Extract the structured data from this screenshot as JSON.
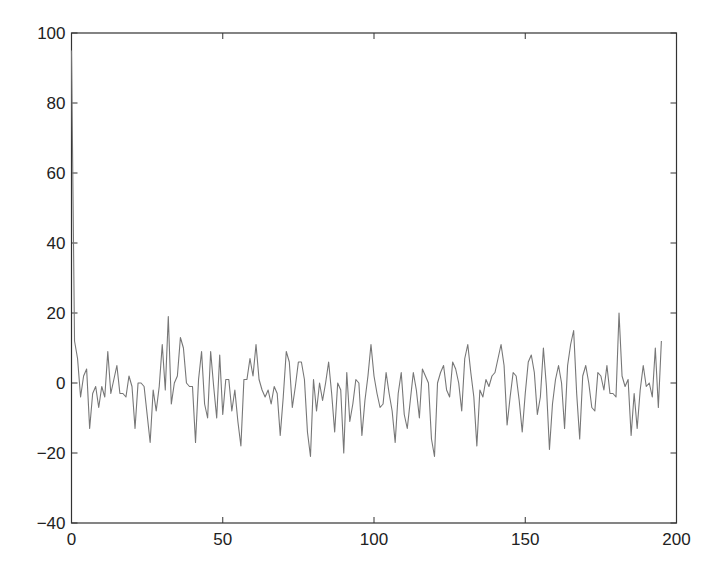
{
  "chart_data": {
    "type": "line",
    "title": "",
    "xlabel": "",
    "ylabel": "",
    "xlim": [
      0,
      200
    ],
    "ylim": [
      -40,
      100
    ],
    "grid": false,
    "legend": null,
    "xticks": [
      0,
      50,
      100,
      150,
      200
    ],
    "yticks": [
      -40,
      -20,
      0,
      20,
      40,
      60,
      80,
      100
    ],
    "line_color": "#777777",
    "series": [
      {
        "name": "signal",
        "x_start": 0,
        "x_step": 1,
        "values": [
          95,
          12,
          7,
          -4,
          2,
          4,
          -13,
          -3,
          -1,
          -7,
          -1,
          -4,
          9,
          -3,
          1,
          5,
          -3,
          -3,
          -4,
          2,
          -1,
          -13,
          0,
          0,
          -1,
          -9,
          -17,
          -2,
          -8,
          -1,
          11,
          -2,
          19,
          -6,
          0,
          2,
          13,
          10,
          0,
          -1,
          -1,
          -17,
          1,
          9,
          -6,
          -10,
          9,
          -1,
          -10,
          8,
          -9,
          1,
          1,
          -8,
          -2,
          -11,
          -18,
          1,
          1,
          7,
          2,
          11,
          1,
          -2,
          -4,
          -2,
          -6,
          -1,
          -3,
          -15,
          -4,
          9,
          6,
          -7,
          -1,
          6,
          6,
          1,
          -14,
          -21,
          1,
          -8,
          0,
          -5,
          0,
          6,
          -3,
          -14,
          0,
          -2,
          -20,
          3,
          -11,
          -6,
          1,
          0,
          -15,
          -5,
          2,
          11,
          2,
          -3,
          -7,
          -6,
          3,
          -3,
          -8,
          -17,
          -3,
          3,
          -9,
          -13,
          -5,
          3,
          -2,
          -10,
          4,
          2,
          0,
          -16,
          -21,
          0,
          3,
          5,
          -2,
          -4,
          6,
          4,
          0,
          -8,
          7,
          11,
          3,
          -4,
          -18,
          -2,
          -4,
          1,
          -1,
          2,
          3,
          7,
          11,
          5,
          -12,
          -4,
          3,
          2,
          -5,
          -14,
          -3,
          6,
          8,
          3,
          -9,
          -4,
          10,
          -1,
          -19,
          -6,
          1,
          5,
          0,
          -13,
          5,
          11,
          15,
          -3,
          -16,
          2,
          5,
          0,
          -7,
          -8,
          3,
          2,
          -2,
          5,
          -3,
          -3,
          -4,
          20,
          2,
          -1,
          1,
          -15,
          -3,
          -13,
          -2,
          5,
          -1,
          0,
          -4,
          10,
          -7,
          12
        ]
      }
    ]
  },
  "axes": {
    "x_tick_labels": [
      "0",
      "50",
      "100",
      "150",
      "200"
    ],
    "y_tick_labels": [
      "100",
      "80",
      "60",
      "40",
      "20",
      "0",
      "-20",
      "-40"
    ]
  }
}
